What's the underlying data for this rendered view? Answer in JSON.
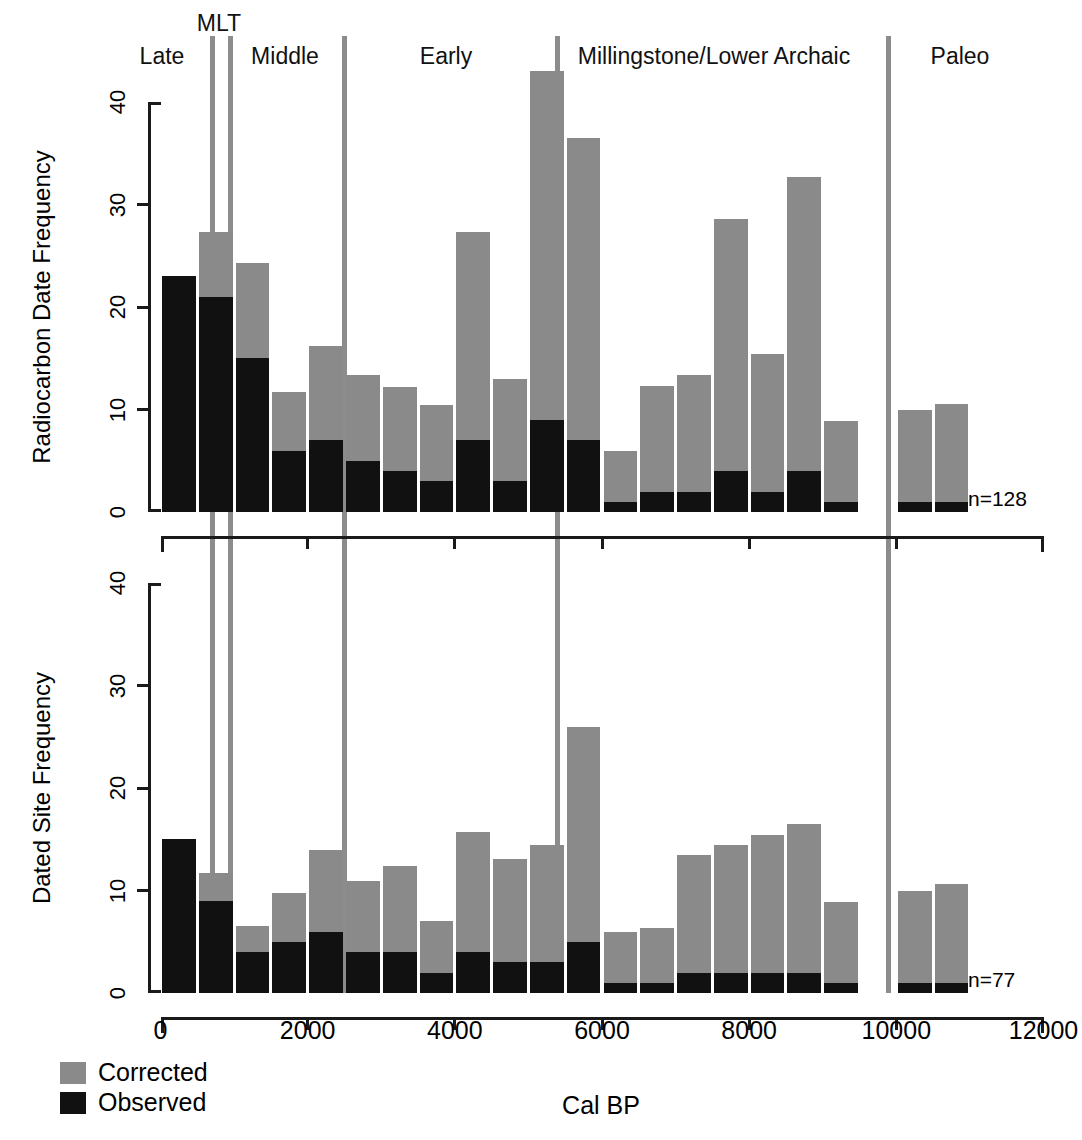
{
  "figure": {
    "periods": [
      {
        "label": "Late",
        "center_x": 162,
        "label_y": 45
      },
      {
        "label": "MLT",
        "center_x": 219,
        "label_y": 12
      },
      {
        "label": "Middle",
        "center_x": 285,
        "label_y": 45
      },
      {
        "label": "Early",
        "center_x": 446,
        "label_y": 45
      },
      {
        "label": "Millingstone/Lower Archaic",
        "center_x": 714,
        "label_y": 45
      },
      {
        "label": "Paleo",
        "center_x": 960,
        "label_y": 45
      }
    ],
    "dividers_cal_bp": [
      700,
      950,
      2500,
      5400,
      9900
    ],
    "legend": {
      "items": [
        {
          "label": "Corrected",
          "color": "#8a8a8a"
        },
        {
          "label": "Observed",
          "color": "#111111"
        }
      ]
    },
    "xaxis_title": "Cal BP"
  },
  "chart_data": [
    {
      "type": "bar",
      "id": "radiocarbon-date-frequency",
      "title": "",
      "xlabel": "Cal BP",
      "ylabel": "Radiocarbon Date Frequency",
      "stacked": true,
      "bin_width": 500,
      "xlim": [
        0,
        12000
      ],
      "ylim": [
        0,
        44
      ],
      "xticks": [
        0,
        2000,
        4000,
        6000,
        8000,
        10000,
        12000
      ],
      "xticklabels": [
        "0",
        "2000",
        "4000",
        "6000",
        "8000",
        "10000",
        "12000"
      ],
      "yticks": [
        0,
        10,
        20,
        30,
        40
      ],
      "yticklabels": [
        "0",
        "10",
        "20",
        "30",
        "40"
      ],
      "grid": false,
      "annotation": "n=128",
      "x": [
        0,
        500,
        1000,
        1500,
        2000,
        2500,
        3000,
        3500,
        4000,
        4500,
        5000,
        5500,
        6000,
        6500,
        7000,
        7500,
        8000,
        8500,
        9000,
        9500,
        10000,
        10500
      ],
      "series": [
        {
          "name": "Observed",
          "values": [
            23,
            21,
            15,
            6,
            7,
            5,
            4,
            3,
            7,
            3,
            9,
            7,
            1,
            2,
            2,
            4,
            2,
            4,
            1,
            0,
            1,
            1
          ]
        },
        {
          "name": "Corrected",
          "values": [
            23,
            27.3,
            24.3,
            11.7,
            16.2,
            13.4,
            12.2,
            10.4,
            27.3,
            13,
            43,
            36.5,
            6,
            12.3,
            13.4,
            28.6,
            15.4,
            32.7,
            8.9,
            0,
            10,
            10.5
          ]
        }
      ]
    },
    {
      "type": "bar",
      "id": "dated-site-frequency",
      "title": "",
      "xlabel": "Cal BP",
      "ylabel": "Dated Site Frequency",
      "stacked": true,
      "bin_width": 500,
      "xlim": [
        0,
        12000
      ],
      "ylim": [
        0,
        44
      ],
      "xticks": [
        0,
        2000,
        4000,
        6000,
        8000,
        10000,
        12000
      ],
      "xticklabels": [
        "0",
        "2000",
        "4000",
        "6000",
        "8000",
        "10000",
        "12000"
      ],
      "yticks": [
        0,
        10,
        20,
        30,
        40
      ],
      "yticklabels": [
        "0",
        "10",
        "20",
        "30",
        "40"
      ],
      "grid": false,
      "annotation": "n=77",
      "x": [
        0,
        500,
        1000,
        1500,
        2000,
        2500,
        3000,
        3500,
        4000,
        4500,
        5000,
        5500,
        6000,
        6500,
        7000,
        7500,
        8000,
        8500,
        9000,
        9500,
        10000,
        10500
      ],
      "series": [
        {
          "name": "Observed",
          "values": [
            15,
            9,
            4,
            5,
            6,
            4,
            4,
            2,
            4,
            3,
            3,
            5,
            1,
            1,
            2,
            2,
            2,
            2,
            1,
            0,
            1,
            1
          ]
        },
        {
          "name": "Corrected",
          "values": [
            15,
            11.7,
            6.5,
            9.8,
            14,
            10.9,
            12.4,
            7,
            15.7,
            13.1,
            14.4,
            26,
            6,
            6.3,
            13.5,
            14.4,
            15.4,
            16.5,
            8.9,
            0,
            10,
            10.6
          ]
        }
      ]
    }
  ]
}
